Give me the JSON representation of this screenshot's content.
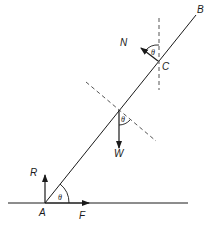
{
  "diagram": {
    "type": "ladder-force-diagram",
    "points": {
      "A": "A",
      "B": "B",
      "C": "C"
    },
    "forces": {
      "R": "R",
      "F": "F",
      "W": "W",
      "N": "N"
    },
    "angles": {
      "at_A": "θ",
      "at_C": "θ",
      "at_G": "θ"
    },
    "colors": {
      "line": "#1a1a1a",
      "dashed": "#555555"
    }
  }
}
